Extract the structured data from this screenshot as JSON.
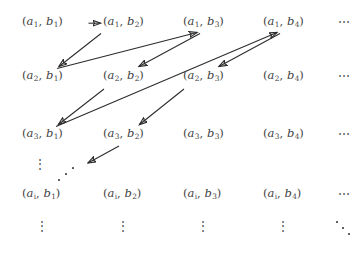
{
  "figure": {
    "background_color": "#ffffff",
    "text_color": "#3f3f3f",
    "arrow_color": "#2b2b2b"
  },
  "grid": {
    "row_labels": [
      "a1",
      "a2",
      "a3",
      "ai"
    ],
    "column_labels": [
      "b1",
      "b2",
      "b3",
      "b4"
    ],
    "rows": [
      {
        "row_index": "1",
        "cells": [
          {
            "open": "(",
            "a": "a",
            "a_sub": "1",
            "comma": ", ",
            "b": "b",
            "b_sub": "1",
            "close": ")"
          },
          {
            "open": "(",
            "a": "a",
            "a_sub": "1",
            "comma": ", ",
            "b": "b",
            "b_sub": "2",
            "close": ")"
          },
          {
            "open": "(",
            "a": "a",
            "a_sub": "1",
            "comma": ", ",
            "b": "b",
            "b_sub": "3",
            "close": ")"
          },
          {
            "open": "(",
            "a": "a",
            "a_sub": "1",
            "comma": ", ",
            "b": "b",
            "b_sub": "4",
            "close": ")"
          }
        ],
        "trailing": "⋯"
      },
      {
        "row_index": "2",
        "cells": [
          {
            "open": "(",
            "a": "a",
            "a_sub": "2",
            "comma": ", ",
            "b": "b",
            "b_sub": "1",
            "close": ")"
          },
          {
            "open": "(",
            "a": "a",
            "a_sub": "2",
            "comma": ", ",
            "b": "b",
            "b_sub": "2",
            "close": ")"
          },
          {
            "open": "(",
            "a": "a",
            "a_sub": "2",
            "comma": ", ",
            "b": "b",
            "b_sub": "3",
            "close": ")"
          },
          {
            "open": "(",
            "a": "a",
            "a_sub": "2",
            "comma": ", ",
            "b": "b",
            "b_sub": "4",
            "close": ")"
          }
        ],
        "trailing": "⋯"
      },
      {
        "row_index": "3",
        "cells": [
          {
            "open": "(",
            "a": "a",
            "a_sub": "3",
            "comma": ", ",
            "b": "b",
            "b_sub": "1",
            "close": ")"
          },
          {
            "open": "(",
            "a": "a",
            "a_sub": "3",
            "comma": ", ",
            "b": "b",
            "b_sub": "2",
            "close": ")"
          },
          {
            "open": "(",
            "a": "a",
            "a_sub": "3",
            "comma": ", ",
            "b": "b",
            "b_sub": "3",
            "close": ")"
          },
          {
            "open": "(",
            "a": "a",
            "a_sub": "3",
            "comma": ", ",
            "b": "b",
            "b_sub": "4",
            "close": ")"
          }
        ],
        "trailing": "⋯"
      },
      {
        "row_index": "i",
        "cells": [
          {
            "open": "(",
            "a": "a",
            "a_sub": "i",
            "comma": ", ",
            "b": "b",
            "b_sub": "1",
            "close": ")"
          },
          {
            "open": "(",
            "a": "a",
            "a_sub": "i",
            "comma": ", ",
            "b": "b",
            "b_sub": "2",
            "close": ")"
          },
          {
            "open": "(",
            "a": "a",
            "a_sub": "i",
            "comma": ", ",
            "b": "b",
            "b_sub": "3",
            "close": ")"
          },
          {
            "open": "(",
            "a": "a",
            "a_sub": "i",
            "comma": ", ",
            "b": "b",
            "b_sub": "4",
            "close": ")"
          }
        ],
        "trailing": "⋯"
      }
    ]
  },
  "ellipses": {
    "gap_vertical": "⋮",
    "gap_diagonal": "⋰",
    "bottom_vertical": "⋮",
    "bottom_diagonal": "⋱"
  },
  "arrows": [
    {
      "name": "a1b1-to-a1b2",
      "from": "(a1,b1)",
      "to": "(a1,b2)",
      "direction": "right"
    },
    {
      "name": "a1b2-to-a2b1",
      "from": "(a1,b2)",
      "to": "(a2,b1)",
      "direction": "down-left"
    },
    {
      "name": "a2b1-to-a1b3",
      "from": "(a2,b1)",
      "to": "(a1,b3)",
      "direction": "up-right"
    },
    {
      "name": "a1b3-to-a2b2",
      "from": "(a1,b3)",
      "to": "(a2,b2)",
      "direction": "down-left"
    },
    {
      "name": "a2b2-to-a3b1",
      "from": "(a2,b2)",
      "to": "(a3,b1)",
      "direction": "down-left"
    },
    {
      "name": "a3b1-to-a1b4",
      "from": "(a3,b1)",
      "to": "(a1,b4)",
      "direction": "up-right"
    },
    {
      "name": "a1b4-to-a2b3",
      "from": "(a1,b4)",
      "to": "(a2,b3)",
      "direction": "down-left"
    },
    {
      "name": "a2b3-to-a3b2",
      "from": "(a2,b3)",
      "to": "(a3,b2)",
      "direction": "down-left"
    },
    {
      "name": "a3b2-to-a4b1",
      "from": "(a3,b2)",
      "to": "(a4,b1)",
      "direction": "down-left"
    }
  ]
}
